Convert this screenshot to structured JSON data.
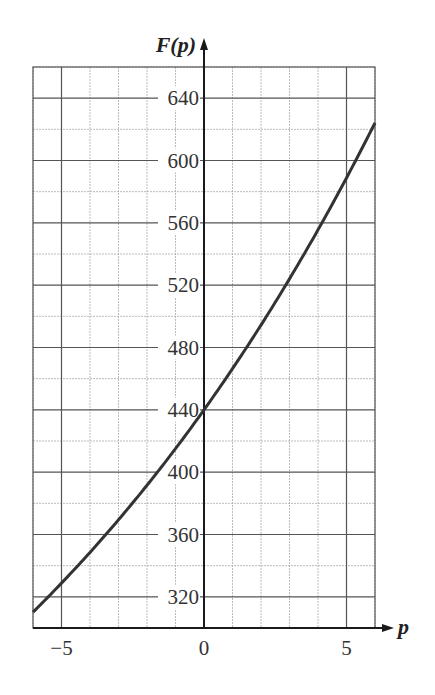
{
  "chart_data": {
    "type": "line",
    "title": "",
    "xlabel": "p",
    "ylabel": "F(p)",
    "xlim": [
      -6,
      6
    ],
    "ylim": [
      300,
      660
    ],
    "x_ticks": [
      -5,
      0,
      5
    ],
    "x_tick_labels": [
      "−5",
      "0",
      "5"
    ],
    "y_ticks": [
      320,
      360,
      400,
      440,
      480,
      520,
      560,
      600,
      640
    ],
    "y_tick_labels": [
      "320",
      "360",
      "400",
      "440",
      "480",
      "520",
      "560",
      "600",
      "640"
    ],
    "grid": {
      "major_x_step": 5,
      "minor_x_step": 1,
      "major_y_step": 40,
      "minor_y_step": 20
    },
    "legend": null,
    "series": [
      {
        "name": "F(p)",
        "color": "#333333",
        "x": [
          -6,
          -5,
          -4,
          -3,
          -2,
          -1,
          0,
          1,
          2,
          3,
          4,
          5,
          6
        ],
        "y": [
          310,
          329,
          349,
          369,
          392,
          415,
          440,
          466,
          494,
          524,
          555,
          589,
          624
        ]
      }
    ]
  },
  "colors": {
    "curve": "#333333",
    "axis": "#1a1a1a",
    "grid_major": "#555555",
    "grid_minor": "#aaaaaa"
  }
}
